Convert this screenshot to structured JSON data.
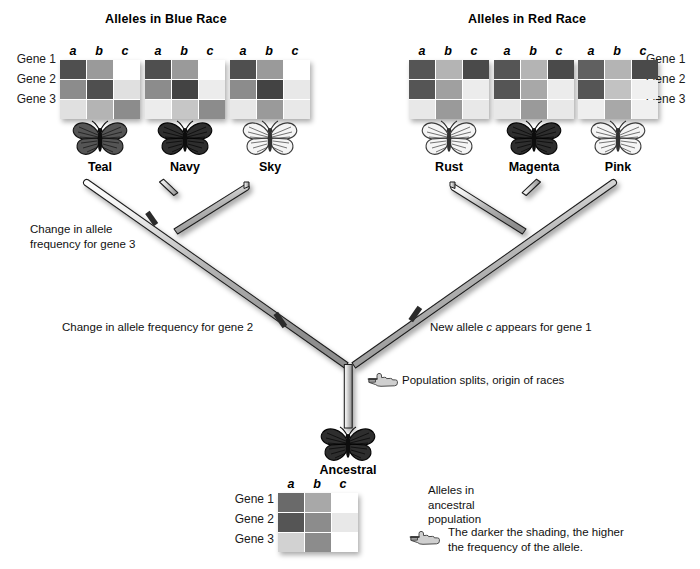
{
  "titles": {
    "blue_race": "Alleles in Blue Race",
    "red_race": "Alleles in Red Race"
  },
  "gene_labels": [
    "Gene 1",
    "Gene 2",
    "Gene 3"
  ],
  "allele_headers": [
    "a",
    "b",
    "c"
  ],
  "shading_levels": {
    "darkest": "#4a4a4a",
    "dark": "#5c5c5c",
    "medium": "#8f8f8f",
    "light": "#c9c9c9",
    "lightest": "#e3e3e3",
    "empty": "#ffffff"
  },
  "taxa": [
    {
      "name": "Teal",
      "race": "blue",
      "butterfly_shade": "medium",
      "grid": [
        [
          "#4f4f4f",
          "#9a9a9a",
          "#ffffff"
        ],
        [
          "#8c8c8c",
          "#4f4f4f",
          "#e0e0e0"
        ],
        [
          "#e0e0e0",
          "#b4b4b4",
          "#8c8c8c"
        ]
      ]
    },
    {
      "name": "Navy",
      "race": "blue",
      "butterfly_shade": "dark",
      "grid": [
        [
          "#4f4f4f",
          "#9a9a9a",
          "#ffffff"
        ],
        [
          "#8c8c8c",
          "#434343",
          "#ececec"
        ],
        [
          "#ececec",
          "#c6c6c6",
          "#8c8c8c"
        ]
      ]
    },
    {
      "name": "Sky",
      "race": "blue",
      "butterfly_shade": "light",
      "grid": [
        [
          "#4f4f4f",
          "#9a9a9a",
          "#ffffff"
        ],
        [
          "#8c8c8c",
          "#434343",
          "#e8e8e8"
        ],
        [
          "#e8e8e8",
          "#9a9a9a",
          "#e8e8e8"
        ]
      ]
    },
    {
      "name": "Rust",
      "race": "red",
      "butterfly_shade": "light",
      "grid": [
        [
          "#555555",
          "#b4b4b4",
          "#4a4a4a"
        ],
        [
          "#555555",
          "#a0a0a0",
          "#ececec"
        ],
        [
          "#e8e8e8",
          "#9a9a9a",
          "#e8e8e8"
        ]
      ]
    },
    {
      "name": "Magenta",
      "race": "red",
      "butterfly_shade": "dark",
      "grid": [
        [
          "#555555",
          "#b4b4b4",
          "#4a4a4a"
        ],
        [
          "#555555",
          "#a8a8a8",
          "#ececec"
        ],
        [
          "#e8e8e8",
          "#9a9a9a",
          "#e8e8e8"
        ]
      ]
    },
    {
      "name": "Pink",
      "race": "red",
      "butterfly_shade": "light",
      "grid": [
        [
          "#606060",
          "#b4b4b4",
          "#4a4a4a"
        ],
        [
          "#555555",
          "#c2c2c2",
          "#f0f0f0"
        ],
        [
          "#eeeeee",
          "#a8a8a8",
          "#f0f0f0"
        ]
      ]
    }
  ],
  "ancestral": {
    "name": "Ancestral",
    "butterfly_shade": "dark",
    "grid": [
      [
        "#6a6a6a",
        "#a8a8a8",
        "#ffffff"
      ],
      [
        "#555555",
        "#8c8c8c",
        "#e8e8e8"
      ],
      [
        "#d2d2d2",
        "#8c8c8c",
        "#ffffff"
      ]
    ]
  },
  "annotations": {
    "gene3_change": "Change in allele\nfrequency for gene 3",
    "gene3_change_line1": "Change in allele",
    "gene3_change_line2": "frequency for gene 3",
    "gene2_change": "Change in allele frequency for gene 2",
    "new_allele": {
      "prefix": "New allele ",
      "italic": "c",
      "suffix": " appears for gene 1"
    },
    "population_split": "Population splits, origin of races",
    "ancestral_caption_line1": "Alleles in",
    "ancestral_caption_line2": "ancestral",
    "ancestral_caption_line3": "population",
    "shading_caption_line1": "The darker the shading, the higher",
    "shading_caption_line2": "the frequency of the allele."
  },
  "icons": {
    "hand": "pointing-hand-icon",
    "butterfly": "butterfly-icon"
  },
  "colors": {
    "branch_fill": "#b9b9b9",
    "branch_highlight": "#f2f2f2",
    "branch_stroke": "#1d1d1d",
    "tick_mark": "#2b2b2b",
    "background": "#ffffff"
  }
}
